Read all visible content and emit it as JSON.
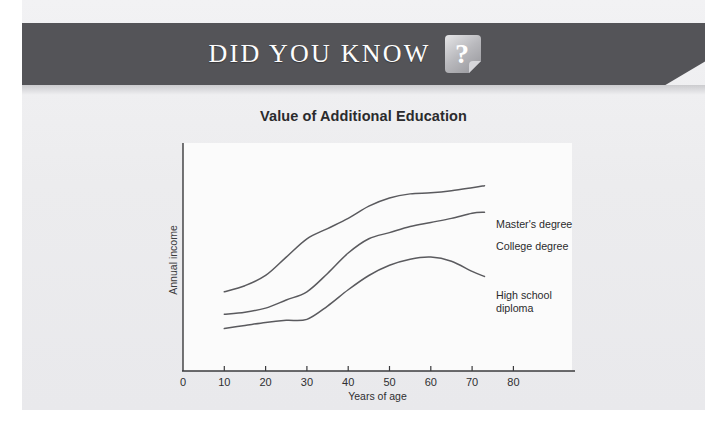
{
  "banner": {
    "title": "DID YOU KNOW",
    "icon": "question-mark-note-icon",
    "bg_color": "#545458",
    "text_color": "#fdfdfd"
  },
  "page": {
    "background_color": "#efeff1"
  },
  "chart_data": {
    "type": "line",
    "title": "Value of Additional Education",
    "xlabel": "Years of age",
    "ylabel": "Annual income",
    "xlim": [
      0,
      90
    ],
    "xticks": [
      "0",
      "10",
      "20",
      "30",
      "40",
      "50",
      "60",
      "70",
      "80"
    ],
    "yticks": [],
    "grid": false,
    "legend_position": "right-inline-annotations",
    "axis_color": "#3a3a3c",
    "line_color": "#5a5a5e",
    "plot_background": "#fbfbfb",
    "x": [
      10,
      15,
      20,
      25,
      30,
      35,
      40,
      45,
      50,
      55,
      60,
      65,
      70,
      73
    ],
    "series": [
      {
        "name": "Master's degree",
        "label": "Master's degree",
        "values": [
          30,
          33,
          38,
          47,
          56,
          61,
          66,
          72,
          76,
          78,
          78.5,
          79.5,
          81,
          82
        ]
      },
      {
        "name": "College degree",
        "label": "College degree",
        "values": [
          19,
          20,
          22,
          26,
          30,
          39,
          49,
          56,
          59,
          62,
          64,
          66,
          68.5,
          69
        ]
      },
      {
        "name": "High school diploma",
        "label": "High school\ndiploma",
        "values": [
          12,
          13.5,
          15,
          16,
          16.5,
          23,
          31,
          38,
          43,
          46,
          47,
          45,
          40,
          37.5
        ]
      }
    ]
  },
  "annotations": {
    "masters_label": "Master's degree",
    "college_label": "College degree",
    "highschool_label": "High school\ndiploma"
  }
}
